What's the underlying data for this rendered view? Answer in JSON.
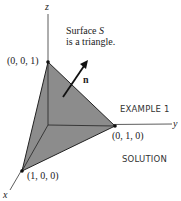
{
  "figure": {
    "caption_line1": "Surface",
    "caption_symbol": "S",
    "caption_line2": "is a triangle.",
    "axes": {
      "x": "x",
      "y": "y",
      "z": "z"
    },
    "points": {
      "z_intercept": "(0, 0, 1)",
      "y_intercept": "(0, 1, 0)",
      "x_intercept": "(1, 0, 0)"
    },
    "normal_label": "n",
    "fill_color": "#8c8c8c"
  },
  "side": {
    "example": "EXAMPLE 1",
    "solution": "SOLUTION"
  }
}
